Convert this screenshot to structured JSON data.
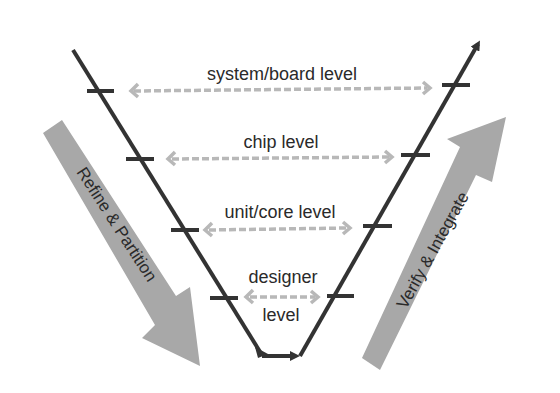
{
  "diagram": {
    "type": "V-model",
    "levels": [
      {
        "label": "system/board level"
      },
      {
        "label": "chip level"
      },
      {
        "label": "unit/core level"
      },
      {
        "label_line1": "designer",
        "label_line2": "level"
      }
    ],
    "left_arrow_label": "Refine & Partition",
    "right_arrow_label": "Verify & Integrate"
  },
  "colors": {
    "line": "#333333",
    "dashed_arrow": "#b5b5b5",
    "big_arrow": "#a8a8a8",
    "text": "#2a2a2a"
  }
}
